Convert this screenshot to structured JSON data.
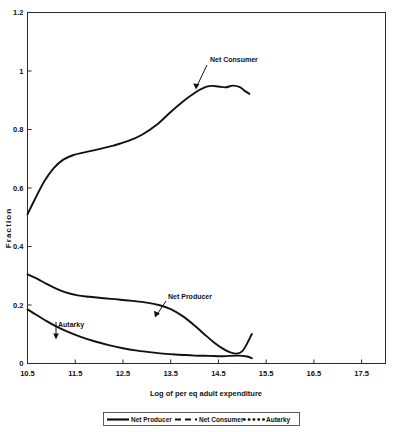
{
  "chart_data": {
    "type": "line",
    "title": "",
    "xlabel": "Log of per eq adult expenditure",
    "ylabel": "Fraction",
    "xlim": [
      10.5,
      18.0
    ],
    "ylim": [
      0,
      1.2
    ],
    "grid": false,
    "legend_position": "bottom",
    "xticks": [
      "10.5",
      "11.5",
      "12.5",
      "13.5",
      "14.5",
      "15.5",
      "16.5",
      "17.5"
    ],
    "xtick_values": [
      10.5,
      11.5,
      12.5,
      13.5,
      14.5,
      15.5,
      16.5,
      17.5
    ],
    "yticks": [
      "0",
      "0.2",
      "0.4",
      "0.6",
      "0.8",
      "1",
      "1.2"
    ],
    "ytick_values": [
      0,
      0.2,
      0.4,
      0.6,
      0.8,
      1,
      1.2
    ],
    "series": [
      {
        "name": "Net Producer",
        "style": "solid",
        "color": "#111111",
        "x": [
          10.5,
          10.7,
          10.9,
          11.1,
          11.3,
          11.55,
          11.8,
          12.1,
          12.4,
          12.7,
          13.0,
          13.25,
          13.5,
          13.75,
          14.0,
          14.2,
          14.4,
          14.6,
          14.75,
          14.9,
          15.0,
          15.1,
          15.2
        ],
        "values": [
          0.305,
          0.29,
          0.272,
          0.256,
          0.243,
          0.233,
          0.228,
          0.223,
          0.219,
          0.214,
          0.208,
          0.2,
          0.186,
          0.162,
          0.13,
          0.101,
          0.073,
          0.05,
          0.038,
          0.034,
          0.042,
          0.068,
          0.101
        ]
      },
      {
        "name": "Net Consumer",
        "style": "dashed",
        "color": "#111111",
        "x": [
          10.5,
          10.65,
          10.85,
          11.05,
          11.25,
          11.45,
          11.7,
          12.0,
          12.3,
          12.6,
          12.9,
          13.2,
          13.5,
          13.75,
          14.0,
          14.2,
          14.35,
          14.5,
          14.65,
          14.8,
          14.95,
          15.05,
          15.15
        ],
        "values": [
          0.51,
          0.56,
          0.622,
          0.668,
          0.697,
          0.712,
          0.722,
          0.733,
          0.745,
          0.76,
          0.782,
          0.815,
          0.86,
          0.895,
          0.925,
          0.943,
          0.949,
          0.947,
          0.944,
          0.95,
          0.945,
          0.932,
          0.922
        ]
      },
      {
        "name": "Autarky",
        "style": "dotted",
        "color": "#111111",
        "x": [
          10.5,
          10.7,
          10.9,
          11.1,
          11.35,
          11.6,
          11.9,
          12.2,
          12.5,
          12.8,
          13.1,
          13.4,
          13.7,
          14.0,
          14.3,
          14.6,
          14.9,
          15.1,
          15.2
        ],
        "values": [
          0.185,
          0.165,
          0.145,
          0.127,
          0.108,
          0.092,
          0.076,
          0.063,
          0.052,
          0.044,
          0.038,
          0.033,
          0.03,
          0.027,
          0.026,
          0.025,
          0.027,
          0.024,
          0.018
        ]
      }
    ],
    "annotations": [
      {
        "label": "Net Consumer",
        "target_x": 13.95,
        "target_y": 0.925
      },
      {
        "label": "Net Producer",
        "target_x": 13.3,
        "target_y": 0.196
      },
      {
        "label": "Autarky",
        "target_x": 11.15,
        "target_y": 0.12
      }
    ],
    "legend": [
      {
        "label": "Net Producer",
        "style": "solid"
      },
      {
        "label": "Net Consumer",
        "style": "dashed"
      },
      {
        "label": "Autarky",
        "style": "dotted"
      }
    ]
  }
}
